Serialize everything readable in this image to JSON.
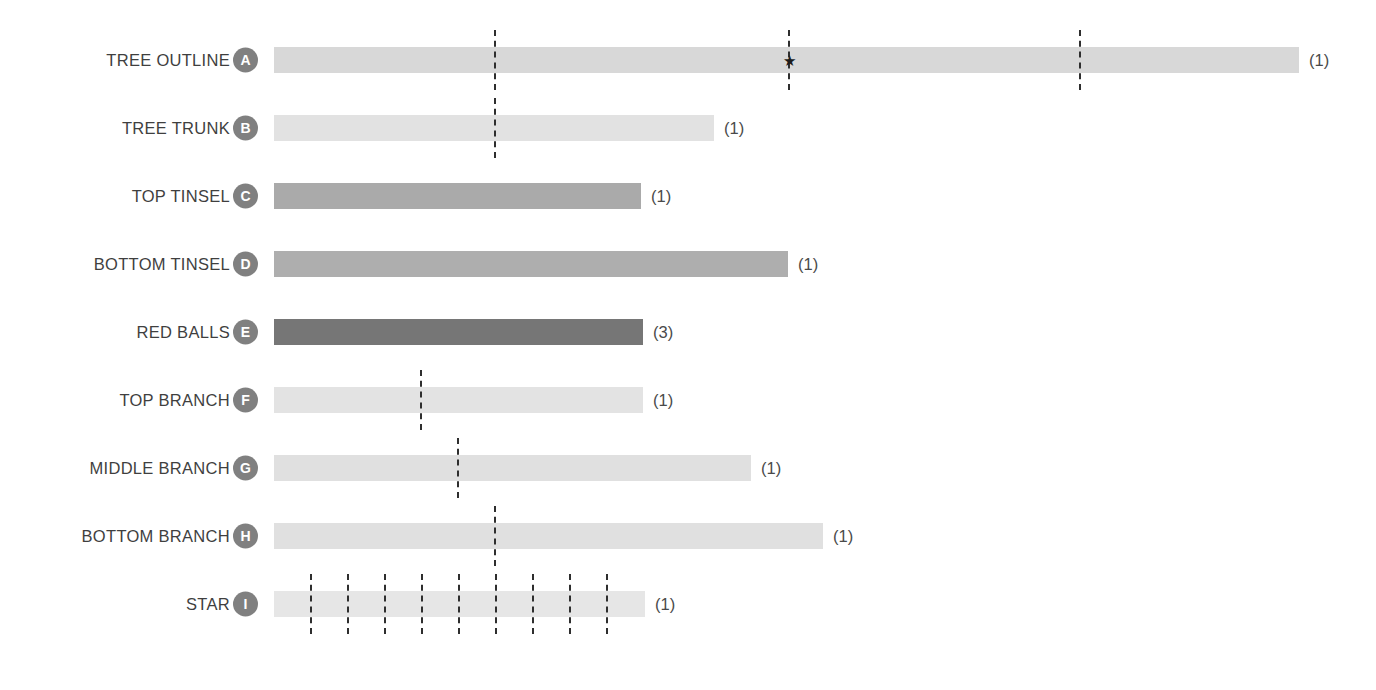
{
  "chart_data": {
    "type": "bar",
    "title": "",
    "xlabel": "",
    "ylabel": "",
    "orientation": "horizontal",
    "grid": false,
    "legend": null,
    "axis_visible": false,
    "x_axis_start_px": 274,
    "categories": [
      "TREE OUTLINE",
      "TREE TRUNK",
      "TOP TINSEL",
      "BOTTOM TINSEL",
      "RED BALLS",
      "TOP BRANCH",
      "MIDDLE BRANCH",
      "BOTTOM BRANCH",
      "STAR"
    ],
    "values": [
      1025,
      440,
      367,
      514,
      369,
      369,
      477,
      549,
      371
    ],
    "counts": [
      "(1)",
      "(1)",
      "(1)",
      "(1)",
      "(3)",
      "(1)",
      "(1)",
      "(1)",
      "(1)"
    ],
    "badges": [
      "A",
      "B",
      "C",
      "D",
      "E",
      "F",
      "G",
      "H",
      "I"
    ],
    "colors": [
      "#d8d8d8",
      "#e2e2e2",
      "#aaaaaa",
      "#aeaeae",
      "#767676",
      "#e3e3e3",
      "#e0e0e0",
      "#e0e0e0",
      "#e6e6e6"
    ]
  },
  "rows": [
    {
      "label": "TREE OUTLINE",
      "badge": "A",
      "count": "(1)",
      "bar_width": 1025,
      "color": "#d8d8d8",
      "markers": [
        220,
        514,
        805
      ],
      "star_marker": 514
    },
    {
      "label": "TREE TRUNK",
      "badge": "B",
      "count": "(1)",
      "bar_width": 440,
      "color": "#e2e2e2",
      "markers": [
        220
      ],
      "star_marker": null
    },
    {
      "label": "TOP TINSEL",
      "badge": "C",
      "count": "(1)",
      "bar_width": 367,
      "color": "#aaaaaa",
      "markers": [],
      "star_marker": null
    },
    {
      "label": "BOTTOM TINSEL",
      "badge": "D",
      "count": "(1)",
      "bar_width": 514,
      "color": "#aeaeae",
      "markers": [],
      "star_marker": null
    },
    {
      "label": "RED BALLS",
      "badge": "E",
      "count": "(3)",
      "bar_width": 369,
      "color": "#767676",
      "markers": [],
      "star_marker": null
    },
    {
      "label": "TOP BRANCH",
      "badge": "F",
      "count": "(1)",
      "bar_width": 369,
      "color": "#e3e3e3",
      "markers": [
        146
      ],
      "star_marker": null
    },
    {
      "label": "MIDDLE BRANCH",
      "badge": "G",
      "count": "(1)",
      "bar_width": 477,
      "color": "#e0e0e0",
      "markers": [
        183
      ],
      "star_marker": null
    },
    {
      "label": "BOTTOM BRANCH",
      "badge": "H",
      "count": "(1)",
      "bar_width": 549,
      "color": "#e0e0e0",
      "markers": [
        220
      ],
      "star_marker": null
    },
    {
      "label": "STAR",
      "badge": "I",
      "count": "(1)",
      "bar_width": 371,
      "color": "#e6e6e6",
      "markers": [
        36,
        73,
        110,
        147,
        184,
        221,
        258,
        295,
        332
      ],
      "star_marker": null
    }
  ],
  "style": {
    "badge_color": "#808080",
    "badge_text_color": "#ffffff",
    "marker_color": "#2e2e2e",
    "label_color": "#3f3f3f",
    "background": "#ffffff",
    "star_glyph": "★"
  }
}
